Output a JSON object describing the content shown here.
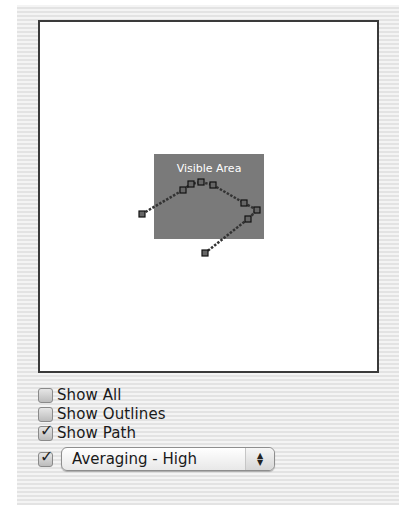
{
  "canvas": {
    "visible_area_label": "Visible Area",
    "visible_area_rect": {
      "x": 114,
      "y": 132,
      "w": 110,
      "h": 85
    },
    "visible_area_color": "#7a7a7a",
    "path_points": [
      {
        "x": 102,
        "y": 192
      },
      {
        "x": 143,
        "y": 168
      },
      {
        "x": 151,
        "y": 162
      },
      {
        "x": 161,
        "y": 160
      },
      {
        "x": 173,
        "y": 163
      },
      {
        "x": 204,
        "y": 181
      },
      {
        "x": 217,
        "y": 188
      },
      {
        "x": 208,
        "y": 197
      },
      {
        "x": 165,
        "y": 231
      }
    ]
  },
  "controls": {
    "show_all": {
      "label": "Show All",
      "checked": false
    },
    "show_outlines": {
      "label": "Show Outlines",
      "checked": false
    },
    "show_path": {
      "label": "Show Path",
      "checked": true
    },
    "averaging": {
      "checked": true,
      "selected": "Averaging - High"
    }
  },
  "icons": {
    "checkmark": "✓",
    "stepper_up": "▲",
    "stepper_down": "▼"
  }
}
